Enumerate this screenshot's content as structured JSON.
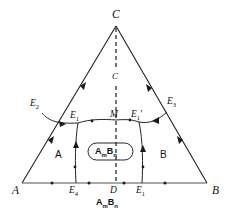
{
  "figure": {
    "kind": "ternary-phase-diagram",
    "colors": {
      "line": "#1a1a1a",
      "axis": "#555555",
      "dashed": "#1a1a1a",
      "background": "#ffffff",
      "text": "#111111"
    }
  },
  "vertices": {
    "a": "A",
    "b": "B",
    "c": "C"
  },
  "points": {
    "e2": "E",
    "e2_sub": "2",
    "e3": "E",
    "e3_sub": "3",
    "e1_left": "E",
    "e1_left_sub": "1",
    "e1_right": "E",
    "e1_right_sub": "1",
    "e1_right_prime": "'",
    "e4": "E",
    "e4_sub": "4",
    "e1_bottom": "E",
    "e1_bottom_sub": "1",
    "m": "M",
    "d": "D",
    "c_inner": "C"
  },
  "regions": {
    "left": "A",
    "right": "B",
    "center": "A",
    "center_sub1": "m",
    "center_sub2": "B",
    "center_sub3": "n"
  },
  "bottom_compound": {
    "el1": "A",
    "sub1": "m",
    "el2": "B",
    "sub2": "n"
  }
}
